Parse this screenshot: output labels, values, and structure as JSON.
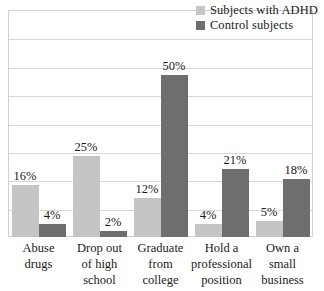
{
  "chart_data": {
    "type": "bar",
    "title": "",
    "subtitle": "",
    "xlabel": "",
    "ylabel": "",
    "ylim": [
      0,
      70
    ],
    "grid": true,
    "gridlines": 7,
    "value_suffix": "%",
    "legend_position": "top-right",
    "categories": [
      "Abuse drugs",
      "Drop out of high school",
      "Graduate from college",
      "Hold a professional position",
      "Own a small business"
    ],
    "category_lines": [
      [
        "Abuse",
        "drugs"
      ],
      [
        "Drop out",
        "of high",
        "school"
      ],
      [
        "Graduate",
        "from",
        "college"
      ],
      [
        "Hold a",
        "professional",
        "position"
      ],
      [
        "Own a",
        "small",
        "business"
      ]
    ],
    "series": [
      {
        "name": "Subjects with ADHD",
        "color": "#c5c5c5",
        "values": [
          16,
          25,
          12,
          4,
          5
        ],
        "labels": [
          "16%",
          "25%",
          "12%",
          "4%",
          "5%"
        ]
      },
      {
        "name": "Control subjects",
        "color": "#6e6e6e",
        "values": [
          4,
          2,
          50,
          21,
          18
        ],
        "labels": [
          "4%",
          "2%",
          "50%",
          "21%",
          "18%"
        ]
      }
    ]
  },
  "legend": {
    "items": [
      {
        "label": "Subjects with ADHD",
        "color": "#c5c5c5"
      },
      {
        "label": "Control subjects",
        "color": "#6e6e6e"
      }
    ]
  },
  "colors": {
    "adhd": "#c5c5c5",
    "control": "#6e6e6e",
    "gridline": "#d9d9d9",
    "frame": "#d2d2d2",
    "text": "#1a1a1a",
    "background": "#ffffff"
  }
}
